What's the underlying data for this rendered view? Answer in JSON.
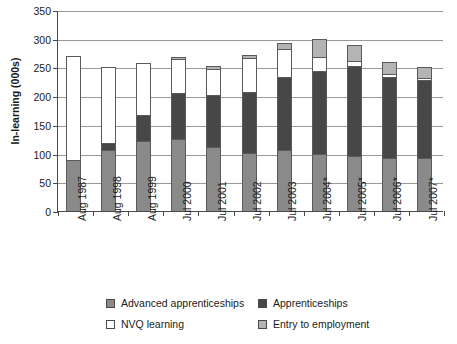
{
  "chart_data": {
    "type": "bar",
    "stacked": true,
    "title": "",
    "xlabel": "",
    "ylabel": "In-learning (000s)",
    "ylim": [
      0,
      350
    ],
    "yticks": [
      0,
      50,
      100,
      150,
      200,
      250,
      300,
      350
    ],
    "grid": true,
    "legend_position": "bottom",
    "categories": [
      "Aug 1987",
      "Aug 1998",
      "Aug 1999",
      "Jul 2000",
      "Jul 2001",
      "Jul 2002",
      "Jul 2003",
      "Jul 2004*",
      "Jul 2005*",
      "Jul 2006*",
      "Jul 2007*"
    ],
    "series": [
      {
        "name": "Advanced apprenticeships",
        "color": "#8a8a8a",
        "values": [
          88,
          107,
          122,
          126,
          112,
          101,
          106,
          99,
          96,
          92,
          93
        ]
      },
      {
        "name": "Apprenticeships",
        "color": "#474747",
        "values": [
          0,
          12,
          46,
          79,
          90,
          107,
          128,
          145,
          157,
          142,
          135
        ]
      },
      {
        "name": "NVQ learning",
        "color": "#ffffff",
        "values": [
          182,
          132,
          89,
          60,
          46,
          58,
          48,
          24,
          9,
          4,
          4
        ]
      },
      {
        "name": "Entry to employment",
        "color": "#b4b4b4",
        "values": [
          0,
          0,
          0,
          3,
          4,
          5,
          10,
          31,
          27,
          21,
          19
        ]
      }
    ],
    "totals": [
      270,
      251,
      257,
      268,
      252,
      271,
      292,
      299,
      289,
      259,
      251
    ]
  },
  "legend": {
    "entries": [
      {
        "label": "Advanced apprenticeships",
        "color": "#8a8a8a"
      },
      {
        "label": "Apprenticeships",
        "color": "#474747"
      },
      {
        "label": "NVQ learning",
        "color": "#ffffff"
      },
      {
        "label": "Entry to employment",
        "color": "#b4b4b4"
      }
    ]
  }
}
